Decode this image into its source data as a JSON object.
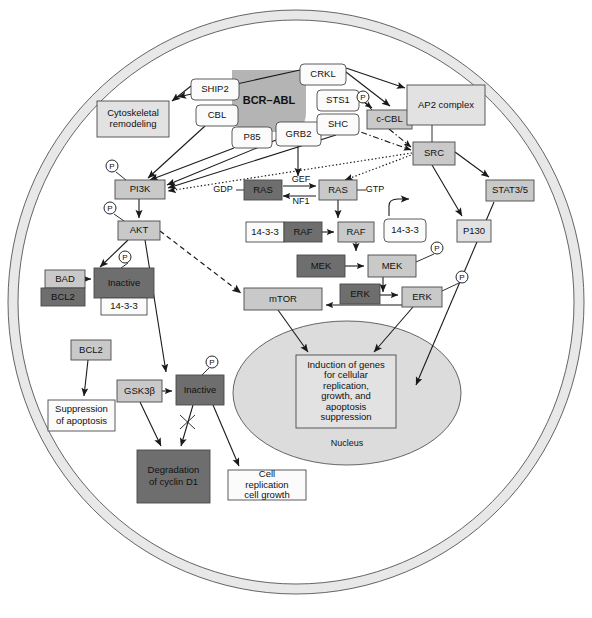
{
  "figure": {
    "membrane_label": "",
    "nucleus_label": "Nucleus"
  },
  "colors": {
    "dark_gray": "#6e6e6e",
    "mid_gray": "#a8a8a8",
    "light_gray": "#c9c9c9",
    "pale_gray": "#e2e2e2",
    "white": "#fbfbfb",
    "membrane": "#e6e6e6",
    "nucleus_fill": "#dcdcdc",
    "bcr_abl_blob": "#b4b4b4",
    "stroke": "#4a4a4a"
  },
  "nodes": [
    {
      "id": "bcr_abl",
      "label": "BCR–ABL",
      "shape": "blob",
      "fill": "bcr_abl_blob",
      "x": 232,
      "y": 70,
      "w": 74,
      "h": 62,
      "bold": true
    },
    {
      "id": "ship2",
      "label": "SHIP2",
      "shape": "round",
      "fill": "white",
      "x": 191,
      "y": 79,
      "w": 48,
      "h": 21
    },
    {
      "id": "cbl",
      "label": "CBL",
      "shape": "round",
      "fill": "white",
      "x": 196,
      "y": 105,
      "w": 42,
      "h": 21
    },
    {
      "id": "p85",
      "label": "P85",
      "shape": "round",
      "fill": "white",
      "x": 232,
      "y": 127,
      "w": 40,
      "h": 21
    },
    {
      "id": "grb2",
      "label": "GRB2",
      "shape": "round",
      "fill": "white",
      "x": 276,
      "y": 122,
      "w": 45,
      "h": 24
    },
    {
      "id": "crkl",
      "label": "CRKL",
      "shape": "round",
      "fill": "white",
      "x": 300,
      "y": 64,
      "w": 46,
      "h": 21
    },
    {
      "id": "sts1",
      "label": "STS1",
      "shape": "round",
      "fill": "white",
      "x": 317,
      "y": 90,
      "w": 42,
      "h": 21
    },
    {
      "id": "shc",
      "label": "SHC",
      "shape": "round",
      "fill": "white",
      "x": 317,
      "y": 114,
      "w": 42,
      "h": 21
    },
    {
      "id": "c_cbl",
      "label": "c-CBL",
      "shape": "rect",
      "fill": "light_gray",
      "x": 367,
      "y": 110,
      "w": 45,
      "h": 19
    },
    {
      "id": "ap2",
      "label": "AP2 complex",
      "shape": "rect",
      "fill": "pale_gray",
      "x": 407,
      "y": 85,
      "w": 78,
      "h": 40
    },
    {
      "id": "src",
      "label": "SRC",
      "shape": "rect",
      "fill": "light_gray",
      "x": 413,
      "y": 142,
      "w": 42,
      "h": 23
    },
    {
      "id": "cyto",
      "label": "Cytoskeletal remodeling",
      "shape": "rect",
      "fill": "pale_gray",
      "x": 97,
      "y": 101,
      "w": 72,
      "h": 36
    },
    {
      "id": "pi3k",
      "label": "PI3K",
      "shape": "rect",
      "fill": "light_gray",
      "x": 115,
      "y": 180,
      "w": 50,
      "h": 19
    },
    {
      "id": "akt",
      "label": "AKT",
      "shape": "rect",
      "fill": "light_gray",
      "x": 118,
      "y": 221,
      "w": 42,
      "h": 19
    },
    {
      "id": "ras_gdp",
      "label": "RAS",
      "shape": "rect",
      "fill": "dark_gray",
      "x": 244,
      "y": 180,
      "w": 38,
      "h": 20
    },
    {
      "id": "ras_gtp",
      "label": "RAS",
      "shape": "rect",
      "fill": "light_gray",
      "x": 319,
      "y": 180,
      "w": 38,
      "h": 20
    },
    {
      "id": "raf_1433",
      "label": "14-3-3",
      "shape": "rect",
      "fill": "white",
      "x": 246,
      "y": 222,
      "w": 38,
      "h": 20
    },
    {
      "id": "raf_dark",
      "label": "RAF",
      "shape": "rect",
      "fill": "dark_gray",
      "x": 284,
      "y": 222,
      "w": 38,
      "h": 20
    },
    {
      "id": "raf_light",
      "label": "RAF",
      "shape": "rect",
      "fill": "light_gray",
      "x": 338,
      "y": 222,
      "w": 36,
      "h": 20
    },
    {
      "id": "free_1433",
      "label": "14-3-3",
      "shape": "round",
      "fill": "white",
      "x": 384,
      "y": 219,
      "w": 42,
      "h": 23
    },
    {
      "id": "p130",
      "label": "P130",
      "shape": "rect",
      "fill": "pale_gray",
      "x": 457,
      "y": 220,
      "w": 34,
      "h": 22
    },
    {
      "id": "stat35",
      "label": "STAT3/5",
      "shape": "rect",
      "fill": "light_gray",
      "x": 486,
      "y": 180,
      "w": 48,
      "h": 21
    },
    {
      "id": "mek_dark",
      "label": "MEK",
      "shape": "rect",
      "fill": "dark_gray",
      "x": 297,
      "y": 255,
      "w": 48,
      "h": 22
    },
    {
      "id": "mek_light",
      "label": "MEK",
      "shape": "rect",
      "fill": "light_gray",
      "x": 368,
      "y": 255,
      "w": 48,
      "h": 22
    },
    {
      "id": "erk_dark",
      "label": "ERK",
      "shape": "rect",
      "fill": "dark_gray",
      "x": 340,
      "y": 284,
      "w": 40,
      "h": 20
    },
    {
      "id": "erk_light",
      "label": "ERK",
      "shape": "rect",
      "fill": "light_gray",
      "x": 402,
      "y": 287,
      "w": 40,
      "h": 20
    },
    {
      "id": "mtor",
      "label": "mTOR",
      "shape": "rect",
      "fill": "light_gray",
      "x": 244,
      "y": 288,
      "w": 78,
      "h": 22
    },
    {
      "id": "bad",
      "label": "BAD",
      "shape": "rect",
      "fill": "light_gray",
      "x": 45,
      "y": 270,
      "w": 40,
      "h": 18
    },
    {
      "id": "bcl2_a",
      "label": "BCL2",
      "shape": "rect",
      "fill": "dark_gray",
      "x": 41,
      "y": 288,
      "w": 44,
      "h": 18
    },
    {
      "id": "akt_inactive",
      "label": "Inactive",
      "shape": "rect",
      "fill": "dark_gray",
      "x": 94,
      "y": 268,
      "w": 60,
      "h": 30
    },
    {
      "id": "inactive_1433",
      "label": "14-3-3",
      "shape": "rect",
      "fill": "white",
      "x": 101,
      "y": 298,
      "w": 46,
      "h": 17
    },
    {
      "id": "bcl2_b",
      "label": "BCL2",
      "shape": "rect",
      "fill": "light_gray",
      "x": 71,
      "y": 340,
      "w": 40,
      "h": 20
    },
    {
      "id": "suppression",
      "label": "Suppression of apoptosis",
      "shape": "rect",
      "fill": "white",
      "x": 48,
      "y": 400,
      "w": 67,
      "h": 31
    },
    {
      "id": "gsk3b",
      "label": "GSK3β",
      "shape": "rect",
      "fill": "light_gray",
      "x": 117,
      "y": 380,
      "w": 45,
      "h": 22
    },
    {
      "id": "gsk_inactive",
      "label": "Inactive",
      "shape": "rect",
      "fill": "dark_gray",
      "x": 176,
      "y": 375,
      "w": 48,
      "h": 30
    },
    {
      "id": "degradation",
      "label": "Degradation of cyclin D1",
      "shape": "rect",
      "fill": "dark_gray",
      "x": 137,
      "y": 450,
      "w": 73,
      "h": 53
    },
    {
      "id": "cell_repl",
      "label": "Cell replication cell growth",
      "shape": "rect",
      "fill": "white",
      "x": 228,
      "y": 470,
      "w": 78,
      "h": 30
    },
    {
      "id": "induction",
      "label": "Induction of genes for cellular replication, growth, and apoptosis suppression",
      "shape": "rect",
      "fill": "pale_gray",
      "x": 296,
      "y": 355,
      "w": 100,
      "h": 73
    }
  ],
  "free_text": [
    {
      "id": "gdp",
      "label": "GDP",
      "x": 223,
      "y": 190
    },
    {
      "id": "gtp",
      "label": "GTP",
      "x": 375,
      "y": 190
    },
    {
      "id": "gef",
      "label": "GEF",
      "x": 301,
      "y": 180
    },
    {
      "id": "nf1",
      "label": "NF1",
      "x": 301,
      "y": 202
    },
    {
      "id": "nucleus",
      "label": "Nucleus",
      "x": 347,
      "y": 444
    }
  ],
  "phospho_markers": [
    {
      "id": "p-pi3k",
      "label": "P",
      "x": 112,
      "y": 166
    },
    {
      "id": "p-akt",
      "label": "P",
      "x": 110,
      "y": 208
    },
    {
      "id": "p-ccbl",
      "label": "P",
      "x": 363,
      "y": 97
    },
    {
      "id": "p-mek",
      "label": "P",
      "x": 437,
      "y": 248
    },
    {
      "id": "p-erk",
      "label": "P",
      "x": 462,
      "y": 277
    },
    {
      "id": "p-inactive-akt",
      "label": "P",
      "x": 125,
      "y": 257
    },
    {
      "id": "p-inactive-gsk",
      "label": "P",
      "x": 212,
      "y": 362
    }
  ],
  "legend_note": ""
}
